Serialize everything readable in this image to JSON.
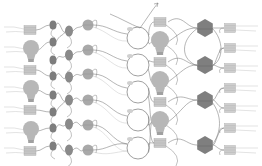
{
  "diagram": {
    "width": 262,
    "height": 166,
    "colors": {
      "background": "#ffffff",
      "line": "#6f6f6f",
      "line_light": "#bdbdbd",
      "square_fill": "#c9c9c9",
      "square_stroke": "#a8a8a8",
      "bulb_fill": "#b7b7b7",
      "bulb_base": "#a0a0a0",
      "dark_oval": "#7d7d7d",
      "mid_oval": "#8a8a8a",
      "light_circle": "#a9a9a9",
      "outline_circle": "#777777",
      "hexagon": "#7f7f7f",
      "right_square": "#cfcfcf"
    },
    "columns": {
      "left_squares": [
        {
          "x": 30,
          "y": 30
        },
        {
          "x": 30,
          "y": 70
        },
        {
          "x": 30,
          "y": 110
        },
        {
          "x": 30,
          "y": 151
        }
      ],
      "left_bulbs": [
        {
          "x": 31,
          "y": 50
        },
        {
          "x": 31,
          "y": 90
        },
        {
          "x": 31,
          "y": 131
        }
      ],
      "small_ovals": [
        {
          "x": 53,
          "y": 25
        },
        {
          "x": 53,
          "y": 42
        },
        {
          "x": 53,
          "y": 60
        },
        {
          "x": 53,
          "y": 76
        },
        {
          "x": 53,
          "y": 95
        },
        {
          "x": 53,
          "y": 112
        },
        {
          "x": 53,
          "y": 128
        },
        {
          "x": 53,
          "y": 146
        }
      ],
      "mid_ovals": [
        {
          "x": 69,
          "y": 31
        },
        {
          "x": 69,
          "y": 55
        },
        {
          "x": 69,
          "y": 77
        },
        {
          "x": 69,
          "y": 100
        },
        {
          "x": 69,
          "y": 124
        },
        {
          "x": 69,
          "y": 150
        }
      ],
      "light_circles": [
        {
          "x": 88,
          "y": 25
        },
        {
          "x": 88,
          "y": 50
        },
        {
          "x": 88,
          "y": 74
        },
        {
          "x": 88,
          "y": 100
        },
        {
          "x": 88,
          "y": 125
        },
        {
          "x": 88,
          "y": 150
        }
      ],
      "outline_circles": [
        {
          "x": 138,
          "y": 38
        },
        {
          "x": 138,
          "y": 65
        },
        {
          "x": 138,
          "y": 92
        },
        {
          "x": 138,
          "y": 120
        },
        {
          "x": 138,
          "y": 148
        }
      ],
      "center_squares": [
        {
          "x": 160,
          "y": 22
        },
        {
          "x": 160,
          "y": 62
        },
        {
          "x": 160,
          "y": 102
        },
        {
          "x": 160,
          "y": 143
        }
      ],
      "center_bulbs": [
        {
          "x": 160,
          "y": 42
        },
        {
          "x": 160,
          "y": 82
        },
        {
          "x": 160,
          "y": 122
        }
      ],
      "hexagons": [
        {
          "x": 205,
          "y": 28
        },
        {
          "x": 205,
          "y": 65
        },
        {
          "x": 205,
          "y": 100
        },
        {
          "x": 205,
          "y": 145
        }
      ],
      "right_squares": [
        {
          "x": 230,
          "y": 28
        },
        {
          "x": 230,
          "y": 48
        },
        {
          "x": 230,
          "y": 68
        },
        {
          "x": 230,
          "y": 88
        },
        {
          "x": 230,
          "y": 108
        },
        {
          "x": 230,
          "y": 128
        },
        {
          "x": 230,
          "y": 150
        }
      ]
    }
  }
}
